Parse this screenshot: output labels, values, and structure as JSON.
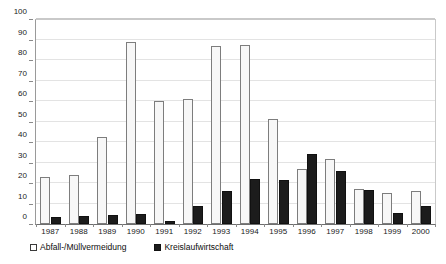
{
  "chart_data": {
    "type": "bar",
    "title": "",
    "subtitle": "",
    "xlabel": "",
    "ylabel": "",
    "ylim": [
      0,
      100
    ],
    "ytick_step": 10,
    "yticks": [
      0,
      10,
      20,
      30,
      40,
      50,
      60,
      70,
      80,
      90,
      100
    ],
    "ytick_labels": [
      "0",
      "10",
      "20",
      "30",
      "40",
      "50",
      "60",
      "70",
      "80",
      "90",
      "100"
    ],
    "grid": true,
    "grid_axis": "y",
    "legend_position": "bottom-left",
    "categories": [
      "1987",
      "1988",
      "1989",
      "1990",
      "1991",
      "1992",
      "1993",
      "1994",
      "1995",
      "1996",
      "1997",
      "1998",
      "1999",
      "2000"
    ],
    "series": [
      {
        "name": "Abfall-/Müllvermeidung",
        "style": "open",
        "fill": "#f7f7f7",
        "edge": "#7d7d7d",
        "values": [
          23,
          24,
          42.5,
          89,
          60,
          61,
          87,
          87.5,
          51,
          27,
          31.5,
          17,
          15,
          16
        ]
      },
      {
        "name": "Kreislaufwirtschaft",
        "style": "filled",
        "fill": "#1c1c1c",
        "edge": "#111111",
        "values": [
          3.5,
          4,
          4.5,
          5,
          1.5,
          9,
          16,
          22,
          21.5,
          34,
          26,
          16.5,
          5.5,
          9
        ]
      }
    ],
    "annotations": []
  },
  "legend": {
    "entries": [
      {
        "label": "Abfall-/Müllvermeidung",
        "swatch": "open"
      },
      {
        "label": "Kreislaufwirtschaft",
        "swatch": "filled"
      }
    ]
  },
  "colors": {
    "background": "#ffffff",
    "axis": "#6e6e6e",
    "grid": "#e3e3e3",
    "series_open_fill": "#f7f7f7",
    "series_open_edge": "#7d7d7d",
    "series_filled": "#1c1c1c",
    "text": "#1a1a1a"
  }
}
